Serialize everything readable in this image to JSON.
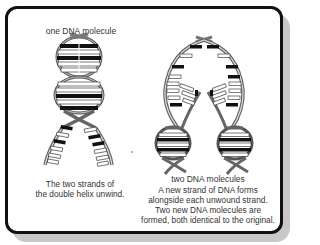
{
  "labels": {
    "left_top": "one DNA molecule",
    "left_caption_1": "The two strands of",
    "left_caption_2": "the double helix unwind.",
    "right_title": "two DNA molecules",
    "right_caption_1": "A new strand of DNA forms",
    "right_caption_2": "alongside each unwound strand.",
    "right_caption_3": "Two new DNA molecules are",
    "right_caption_4": "formed, both identical to the original."
  },
  "colors": {
    "border": "#111111",
    "shadow": "#c8c8c8",
    "strand": "#888888",
    "base_dark": "#111111",
    "base_light": "#ffffff",
    "text": "#333333"
  },
  "icons": {
    "left_figure": "dna-unwinding-helix",
    "right_figure": "dna-replicated-helices"
  }
}
